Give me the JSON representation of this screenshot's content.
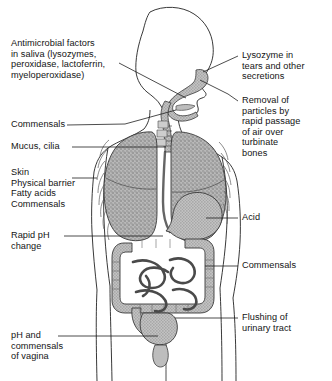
{
  "figure": {
    "background": "#ffffff",
    "ink": "#141414",
    "organ_fill": "#a8a8a8",
    "organ_fill_light": "#c9c9c9",
    "organ_fill_dark": "#8d8d8d"
  },
  "labels": {
    "saliva": "Antimicrobial factors\nin saliva (lysozymes,\nperoxidase, lactoferrin,\nmyeloperoxidase)",
    "commensals_mouth": "Commensals",
    "mucus_cilia": "Mucus, cilia",
    "skin": "Skin\nPhysical barrier\nFatty acids\nCommensals",
    "rapid_ph": "Rapid pH\nchange",
    "vagina": "pH and\ncommensals\nof vagina",
    "lysozyme": "Lysozyme in\ntears and other\nsecretions",
    "turbinate": "Removal of\nparticles by\nrapid passage\nof air over\nturbinate\nbones",
    "acid": "Acid",
    "commensals_gut": "Commensals",
    "urinary": "Flushing of\nurinary tract"
  }
}
